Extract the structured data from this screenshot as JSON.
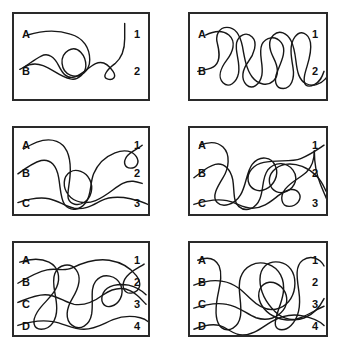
{
  "figure": {
    "type": "tangled-lines-matching-puzzle",
    "columns": 2,
    "rows": 3,
    "stroke_color": "#171717",
    "border_color": "#2a2a2a",
    "background_color": "#ffffff"
  },
  "panels": [
    {
      "id": "panel-1",
      "position": "top-left",
      "strand_count": 2,
      "left_labels": [
        "A",
        "B"
      ],
      "right_labels": [
        "1",
        "2"
      ],
      "rect": {
        "x": 12,
        "y": 12,
        "w": 138,
        "h": 89
      }
    },
    {
      "id": "panel-2",
      "position": "top-right",
      "strand_count": 2,
      "left_labels": [
        "A",
        "B"
      ],
      "right_labels": [
        "1",
        "2"
      ],
      "rect": {
        "x": 188,
        "y": 12,
        "w": 140,
        "h": 89
      }
    },
    {
      "id": "panel-3",
      "position": "middle-left",
      "strand_count": 3,
      "left_labels": [
        "A",
        "B",
        "C"
      ],
      "right_labels": [
        "1",
        "2",
        "3"
      ],
      "rect": {
        "x": 12,
        "y": 126,
        "w": 138,
        "h": 90
      }
    },
    {
      "id": "panel-4",
      "position": "middle-right",
      "strand_count": 3,
      "left_labels": [
        "A",
        "B",
        "C"
      ],
      "right_labels": [
        "1",
        "2",
        "3"
      ],
      "rect": {
        "x": 188,
        "y": 126,
        "w": 140,
        "h": 90
      }
    },
    {
      "id": "panel-5",
      "position": "bottom-left",
      "strand_count": 4,
      "left_labels": [
        "A",
        "B",
        "C",
        "D"
      ],
      "right_labels": [
        "1",
        "2",
        "3",
        "4"
      ],
      "rect": {
        "x": 12,
        "y": 241,
        "w": 138,
        "h": 96
      }
    },
    {
      "id": "panel-6",
      "position": "bottom-right",
      "strand_count": 4,
      "left_labels": [
        "A",
        "B",
        "C",
        "D"
      ],
      "right_labels": [
        "1",
        "2",
        "3",
        "4"
      ],
      "rect": {
        "x": 188,
        "y": 241,
        "w": 140,
        "h": 96
      }
    }
  ],
  "labels": {
    "letters": [
      "A",
      "B",
      "C",
      "D"
    ],
    "numbers": [
      "1",
      "2",
      "3",
      "4"
    ]
  },
  "paths": {
    "panel1": [
      "M 14 22 C 30 17, 46 17, 58 21 C 72 25, 78 36, 78 48 C 78 60, 68 68, 58 64 C 48 60, 46 44, 56 38 C 66 32, 74 44, 74 54 C 74 62, 66 70, 58 68 C 48 66, 40 58, 30 54 C 22 51, 16 52, 10 56",
      "M 6 58 C 14 54, 20 48, 28 44 C 36 40, 42 46, 46 54 C 50 62, 54 68, 62 66 C 70 64, 76 56, 84 52 C 92 48, 98 54, 102 60 C 106 66, 102 70, 96 68 C 90 66, 96 58, 104 52 C 110 47, 114 38, 114 26 C 114 18, 114 14, 114 10"
    ],
    "panel2": [
      "M 16 22 C 26 17, 34 17, 40 22 C 48 29, 44 40, 38 48 C 32 56, 28 66, 34 72 C 40 78, 48 72, 50 62 C 52 50, 46 40, 48 30 C 50 22, 58 18, 64 24 C 70 30, 66 42, 60 50 C 54 58, 52 68, 58 74 C 64 80, 72 74, 74 64 C 76 52, 70 42, 74 32 C 78 24, 88 22, 94 30 C 100 38, 94 50, 90 60 C 86 70, 88 78, 96 78 C 104 78, 108 68, 106 56 C 104 44, 102 32, 108 24 C 114 16, 122 20, 124 30 C 126 42, 120 54, 118 64 C 116 74, 120 78, 128 74 C 134 71, 136 66, 138 60",
      "M 8 60 C 16 58, 22 58, 26 54 C 32 48, 30 38, 28 30 C 26 22, 30 14, 38 14 C 48 14, 52 24, 54 34 C 56 46, 58 58, 64 66 C 70 74, 80 76, 86 70 C 92 64, 90 54, 86 46 C 82 38, 80 28, 86 22 C 92 16, 100 20, 104 28 C 110 40, 108 54, 112 64 C 115 72, 122 76, 130 74 C 136 72, 140 68, 142 64"
    ],
    "panel3": [
      "M 10 22 C 22 14, 34 10, 44 14 C 54 18, 58 30, 58 44 C 58 58, 54 68, 56 74 C 58 80, 66 82, 72 78 C 80 73, 82 62, 78 54 C 74 46, 64 42, 58 46 C 50 51, 50 62, 56 70 C 62 78, 74 80, 84 76 C 96 71, 104 62, 112 58 C 120 54, 126 56, 132 58",
      "M 4 48 C 12 42, 20 36, 28 34 C 38 32, 44 40, 46 52 C 48 64, 48 74, 52 80 C 58 88, 68 86, 74 78 C 80 70, 78 58, 82 48 C 86 38, 94 30, 104 26 C 114 22, 122 24, 126 30 C 130 36, 126 42, 120 42 C 114 42, 112 36, 116 30 C 120 24, 128 22, 132 18",
      "M 4 78 C 16 74, 26 72, 36 74 C 46 76, 52 82, 62 84 C 74 86, 82 80, 90 76 C 100 71, 110 72, 120 74 C 128 76, 134 78, 138 80"
    ],
    "panel4": [
      "M 10 18 C 20 14, 28 14, 34 20 C 42 28, 40 42, 34 52 C 28 62, 22 72, 28 78 C 34 84, 46 80, 52 70 C 58 60, 58 46, 64 38 C 72 28, 84 30, 88 40 C 92 50, 86 60, 78 64 C 70 68, 62 64, 60 56 C 58 46, 66 38, 76 36 C 90 33, 104 36, 114 32 C 124 28, 132 22, 138 18",
      "M 4 52 C 12 46, 18 40, 26 38 C 36 36, 42 44, 44 54 C 46 66, 44 76, 50 82 C 58 89, 68 84, 72 74 C 76 64, 74 52, 80 44 C 88 34, 100 36, 106 44 C 112 52, 108 62, 100 66 C 92 70, 84 66, 82 58 C 80 48, 88 40, 98 38 C 110 36, 122 42, 130 50 C 136 56, 138 62, 140 66",
      "M 4 80 C 16 76, 28 74, 38 76 C 48 78, 54 84, 64 84 C 76 84, 84 76, 92 70 C 100 64, 108 62, 112 68 C 116 74, 110 82, 102 82 C 94 82, 92 72, 98 64 C 104 56, 114 52, 120 46 C 126 40, 128 32, 128 24",
      "M 128 24 C 128 34, 130 48, 134 58 C 137 66, 140 72, 142 78"
    ],
    "panel5": [
      "M 6 20 C 18 16, 28 16, 36 20 C 46 25, 48 36, 44 46 C 40 56, 30 62, 24 72 C 18 82, 20 90, 28 90 C 38 90, 44 80, 44 68 C 44 54, 38 42, 42 32 C 46 22, 58 20, 64 28 C 70 36, 66 48, 60 58 C 54 68, 52 80, 60 86 C 68 92, 78 86, 80 74 C 82 60, 78 48, 84 40 C 92 30, 106 34, 110 44 C 114 54, 108 64, 100 66 C 92 68, 88 60, 92 52 C 96 44, 108 42, 118 44 C 126 46, 132 50, 136 54",
      "M 4 42 C 14 36, 24 30, 34 28 C 44 26, 52 30, 60 26 C 72 20, 84 16, 98 18 C 110 20, 120 26, 126 34 C 132 42, 130 50, 122 52 C 114 54, 110 46, 114 38 C 118 30, 128 26, 134 22",
      "M 4 62 C 14 58, 22 54, 32 54 C 44 54, 52 62, 62 64 C 74 66, 84 60, 92 54 C 102 47, 112 46, 120 50 C 128 54, 132 60, 136 64",
      "M 4 86 C 16 82, 28 80, 40 82 C 52 84, 60 90, 72 90 C 84 90, 92 84, 102 80 C 112 76, 122 76, 130 78 C 134 79, 136 80, 138 82"
    ],
    "panel6": [
      "M 8 18 C 18 14, 26 16, 30 24 C 34 34, 30 46, 28 58 C 26 70, 26 82, 32 88 C 40 94, 50 88, 52 76 C 54 62, 48 48, 52 36 C 56 24, 68 18, 80 22 C 92 26, 98 38, 96 52 C 94 66, 86 78, 88 86 C 90 92, 98 92, 104 86 C 112 78, 114 64, 112 50 C 110 36, 108 24, 116 18 C 124 12, 134 16, 138 24",
      "M 4 44 C 14 40, 24 38, 34 40 C 46 42, 54 50, 62 58 C 72 68, 82 72, 92 68 C 102 64, 108 54, 108 42 C 108 30, 102 22, 92 20 C 80 18, 72 26, 72 38 C 72 52, 80 64, 88 72 C 96 80, 108 82, 118 78 C 128 74, 134 66, 138 58",
      "M 4 68 C 16 64, 28 62, 38 64 C 50 66, 58 74, 68 78 C 80 82, 90 78, 96 70 C 102 62, 100 52, 94 46 C 86 38, 76 40, 72 48 C 68 58, 74 68, 82 74 C 92 81, 104 82, 114 78 C 124 74, 132 68, 138 66",
      "M 4 90 C 14 86, 22 84, 30 86 C 40 89, 44 96, 54 96 C 66 96, 74 88, 84 82 C 94 76, 106 74, 116 76 C 126 78, 134 82, 138 86"
    ]
  }
}
